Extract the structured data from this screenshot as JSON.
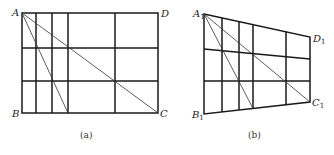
{
  "figure_a": {
    "caption": "(a)",
    "labels": {
      "A": "A",
      "B": "B",
      "C": "C",
      "D": "D"
    },
    "rect": {
      "x1": 22,
      "y1": 13,
      "x2": 158,
      "y2": 113
    },
    "verticals_x": [
      36,
      52,
      68,
      115
    ],
    "horizontals_y": [
      48,
      81
    ],
    "diagonals": [
      {
        "from": "A",
        "to": "C"
      },
      {
        "from": "A",
        "to": "bottom@68"
      }
    ]
  },
  "figure_b": {
    "caption": "(b)",
    "labels": {
      "A": "A",
      "B": "B",
      "C": "C",
      "D": "D",
      "sub": "1"
    },
    "corners": {
      "A1": [
        204,
        14
      ],
      "D1": [
        310,
        37
      ],
      "C1": [
        310,
        102
      ],
      "B1": [
        204,
        114
      ]
    },
    "verticals_x": [
      222,
      239,
      253,
      286
    ],
    "diagonals": [
      {
        "from": "A1",
        "to": "C1"
      },
      {
        "from": "A1",
        "to": "bottom@253"
      }
    ]
  }
}
